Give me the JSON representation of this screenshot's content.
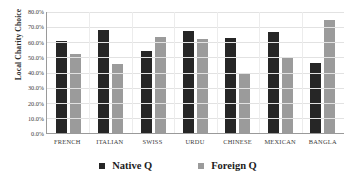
{
  "chart_data": {
    "type": "bar",
    "title": "",
    "xlabel": "",
    "ylabel": "Local Charity Choice",
    "ylim": [
      0,
      80
    ],
    "ytick_labels": [
      "80.0%",
      "70.0%",
      "60.0%",
      "50.0%",
      "40.0%",
      "30.0%",
      "20.0%",
      "10.0%",
      "0.0%"
    ],
    "ytick_values": [
      80,
      70,
      60,
      50,
      40,
      30,
      20,
      10,
      0
    ],
    "grid": true,
    "legend_position": "bottom",
    "categories": [
      "FRENCH",
      "ITALIAN",
      "SWISS",
      "URDU",
      "CHINESE",
      "MEXICAN",
      "BANGLA"
    ],
    "series": [
      {
        "name": "Native Q",
        "color": "#262626",
        "values": [
          61.0,
          68.0,
          54.0,
          67.5,
          63.0,
          66.5,
          46.5
        ]
      },
      {
        "name": "Foreign Q",
        "color": "#9b9b9b",
        "values": [
          52.0,
          45.5,
          63.5,
          62.0,
          40.0,
          49.5,
          75.0
        ]
      }
    ]
  }
}
